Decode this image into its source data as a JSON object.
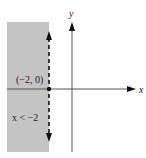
{
  "diagram": {
    "type": "inequality-graph",
    "inequality_label": "x < −2",
    "point_label": "(−2, 0)",
    "x_axis_label": "x",
    "y_axis_label": "y",
    "boundary": {
      "x": -2,
      "style": "dashed"
    },
    "shaded_side": "left",
    "colors": {
      "shade": "#c4c4c4",
      "axis": "#555555",
      "boundary": "#111111",
      "point": "#111111"
    }
  }
}
